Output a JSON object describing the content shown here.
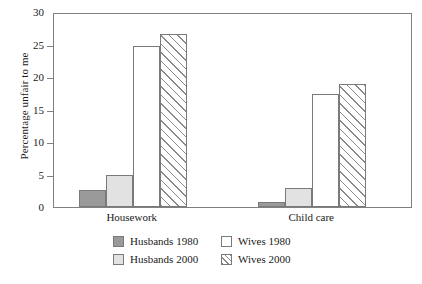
{
  "chart_data": {
    "type": "bar",
    "title": "",
    "xlabel": "",
    "ylabel": "Percentage unfair to me",
    "categories": [
      "Housework",
      "Child care"
    ],
    "series": [
      {
        "name": "Husbands 1980",
        "values": [
          2.6,
          0.8
        ],
        "color": "#9a9a9a",
        "fill": "solid-dark-gray"
      },
      {
        "name": "Husbands 2000",
        "values": [
          4.9,
          3.0
        ],
        "color": "#e2e2e2",
        "fill": "solid-light-gray"
      },
      {
        "name": "Wives 1980",
        "values": [
          24.7,
          17.4
        ],
        "color": "#ffffff",
        "fill": "white"
      },
      {
        "name": "Wives 2000",
        "values": [
          26.6,
          18.9
        ],
        "color": "#ffffff",
        "fill": "diagonal-hatch"
      }
    ],
    "ylim": [
      0,
      30
    ],
    "yticks": [
      0,
      5,
      10,
      15,
      20,
      25,
      30
    ],
    "ytick_labels": [
      "0",
      "5",
      "10",
      "15",
      "20",
      "25",
      "30"
    ],
    "grid": false,
    "legend_position": "bottom"
  },
  "legend": {
    "entries": [
      {
        "label": "Husbands 1980"
      },
      {
        "label": "Wives 1980"
      },
      {
        "label": "Husbands 2000"
      },
      {
        "label": "Wives 2000"
      }
    ]
  }
}
